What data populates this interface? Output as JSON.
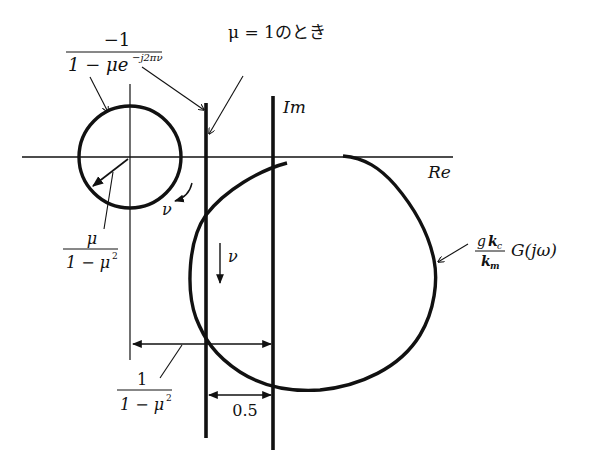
{
  "diagram": {
    "type": "nyquist-plot",
    "axes": {
      "real_label": "Re",
      "imag_label": "Im"
    },
    "labels": {
      "small_circle": {
        "numerator": "−1",
        "denominator_main": "1 − μe",
        "denominator_exp": "−j2πν"
      },
      "mu_one": "μ = 1のとき",
      "radius": {
        "numerator": "μ",
        "denominator_main": "1 − μ",
        "denominator_exp": "2"
      },
      "center_offset": {
        "numerator": "1",
        "denominator_main": "1 − μ",
        "denominator_exp": "2"
      },
      "half": "0.5",
      "nu_small": "ν",
      "nu_large": "ν",
      "transfer": {
        "numerator_g": "g",
        "numerator_k": "k",
        "numerator_sub": "c",
        "denominator_k": "k",
        "denominator_sub": "m",
        "function": "G(jω)"
      }
    },
    "colors": {
      "ink": "#111111",
      "background": "#ffffff"
    }
  }
}
